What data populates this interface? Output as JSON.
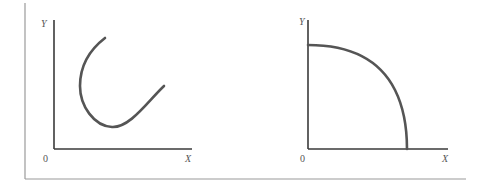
{
  "figure": {
    "colors": {
      "axis": "#3a3a3a",
      "curve": "#555555",
      "frame": "#9a9a9a",
      "text": "#555555"
    },
    "panels": [
      {
        "id": "left",
        "y_label": "Y",
        "x_label": "X",
        "origin_label": "0",
        "curve_shape": "backward-bending U-shaped curve"
      },
      {
        "id": "right",
        "y_label": "Y",
        "x_label": "X",
        "origin_label": "0",
        "curve_shape": "concave quarter-ellipse (production possibility frontier)"
      }
    ]
  }
}
